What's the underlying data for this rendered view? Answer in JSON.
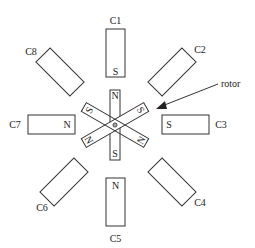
{
  "diagram": {
    "type": "stepper-motor-schematic",
    "stroke_color": "#333333",
    "background": "#ffffff",
    "center": [
      115,
      125
    ],
    "stator_coils": [
      {
        "id": "c1",
        "label": "C1",
        "pole": "S"
      },
      {
        "id": "c2",
        "label": "C2",
        "pole": ""
      },
      {
        "id": "c3",
        "label": "C3",
        "pole": "S"
      },
      {
        "id": "c4",
        "label": "C4",
        "pole": ""
      },
      {
        "id": "c5",
        "label": "C5",
        "pole": "N"
      },
      {
        "id": "c6",
        "label": "C6",
        "pole": ""
      },
      {
        "id": "c7",
        "label": "C7",
        "pole": "N"
      },
      {
        "id": "c8",
        "label": "C8",
        "pole": ""
      }
    ],
    "rotor": {
      "label": "rotor",
      "arms": [
        {
          "angle": 90,
          "end_a": "N",
          "end_b": "S"
        },
        {
          "angle": 30,
          "end_a": "S",
          "end_b": "N"
        },
        {
          "angle": 150,
          "end_a": "S",
          "end_b": "N"
        }
      ]
    }
  }
}
